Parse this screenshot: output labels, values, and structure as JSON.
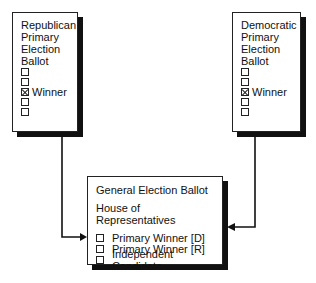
{
  "republican_ballot": {
    "title_lines": [
      "Republican",
      "Primary",
      "Election",
      "Ballot"
    ],
    "options": [
      {
        "checked": false,
        "label": ""
      },
      {
        "checked": false,
        "label": ""
      },
      {
        "checked": true,
        "label": "Winner"
      },
      {
        "checked": false,
        "label": ""
      },
      {
        "checked": false,
        "label": ""
      }
    ]
  },
  "democratic_ballot": {
    "title_lines": [
      "Democratic",
      "Primary",
      "Election",
      "Ballot"
    ],
    "options": [
      {
        "checked": false,
        "label": ""
      },
      {
        "checked": false,
        "label": ""
      },
      {
        "checked": true,
        "label": "Winner"
      },
      {
        "checked": false,
        "label": ""
      },
      {
        "checked": false,
        "label": ""
      }
    ]
  },
  "general_ballot": {
    "title": "General Election Ballot",
    "subtitle": "House of Representatives",
    "options": [
      {
        "checked": false,
        "label": "Primary Winner [D]"
      },
      {
        "checked": false,
        "label": "Primary Winner [R]"
      },
      {
        "checked": false,
        "label": "Independent Candidate"
      }
    ]
  },
  "connectors": [
    {
      "from": "republican_ballot",
      "to": "general_ballot"
    },
    {
      "from": "democratic_ballot",
      "to": "general_ballot"
    }
  ]
}
